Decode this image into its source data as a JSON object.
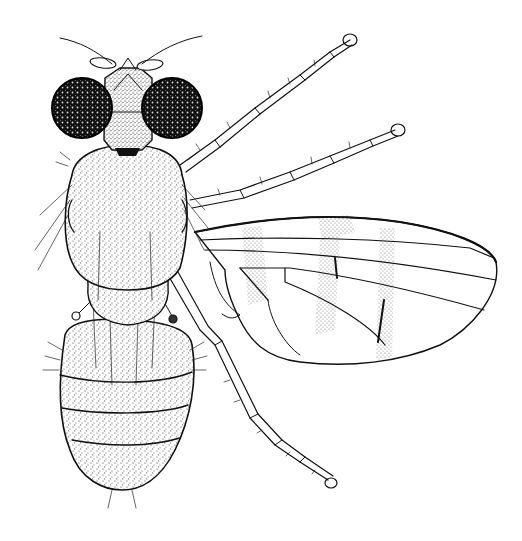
{
  "figure": {
    "subject": "Fly (Diptera), dorsal view, pen-and-ink scientific illustration",
    "background": "#ffffff",
    "ink": "#111111",
    "parts": {
      "head": "head",
      "eyes": "compound eyes",
      "antennae": "antennae with arista",
      "thorax": "thorax (mesonotum)",
      "scutellum": "scutellum",
      "abdomen": "abdomen with segments",
      "wing": "right wing with banded markings",
      "legs": "right legs (fore, mid, hind)",
      "halteres": "halteres"
    }
  }
}
